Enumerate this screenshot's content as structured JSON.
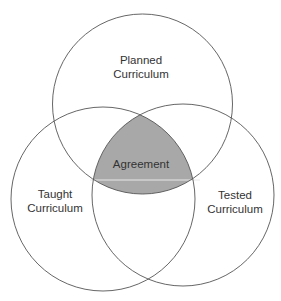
{
  "diagram": {
    "type": "venn",
    "sets": [
      {
        "id": "planned",
        "lines": [
          "Planned",
          "Curriculum"
        ]
      },
      {
        "id": "taught",
        "lines": [
          "Taught",
          "Curriculum"
        ]
      },
      {
        "id": "tested",
        "lines": [
          "Tested",
          "Curriculum"
        ]
      }
    ],
    "intersection": {
      "label": "Agreement",
      "fill": "#a8a8a8"
    },
    "stroke_color": "#555555"
  }
}
